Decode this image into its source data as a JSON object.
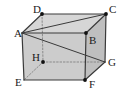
{
  "figure": {
    "kind": "geometry-diagram",
    "shape_name": "rectangular-cuboid",
    "stroke_color": "#3a3a3a",
    "dashed_color": "#8a8a8a",
    "face_fill_top": "#d6d6d6",
    "face_fill_front": "#cccccc",
    "face_fill_right": "#bfbfbf",
    "background_color": "#ffffff",
    "vertex_dot_color": "#111111",
    "vertices": [
      {
        "id": "A",
        "label": "A",
        "x": 22,
        "y": 33,
        "label_x": 14,
        "label_y": 37,
        "dot": false
      },
      {
        "id": "B",
        "label": "B",
        "x": 86,
        "y": 33,
        "label_x": 89,
        "label_y": 44,
        "dot": true
      },
      {
        "id": "C",
        "label": "C",
        "x": 106,
        "y": 14,
        "label_x": 109,
        "label_y": 13,
        "dot": true
      },
      {
        "id": "D",
        "label": "D",
        "x": 42,
        "y": 14,
        "label_x": 33,
        "label_y": 13,
        "dot": true
      },
      {
        "id": "E",
        "label": "E",
        "x": 24,
        "y": 80,
        "label_x": 15,
        "label_y": 86,
        "dot": false
      },
      {
        "id": "F",
        "label": "F",
        "x": 85,
        "y": 80,
        "label_x": 89,
        "label_y": 88,
        "dot": true
      },
      {
        "id": "G",
        "label": "G",
        "x": 105,
        "y": 62,
        "label_x": 108,
        "label_y": 66,
        "dot": false
      },
      {
        "id": "H",
        "label": "H",
        "x": 43,
        "y": 62,
        "label_x": 32,
        "label_y": 61,
        "dot": true
      }
    ],
    "solid_edges": [
      {
        "from": "D",
        "to": "C",
        "name": "edge-DC"
      },
      {
        "from": "D",
        "to": "A",
        "name": "edge-DA"
      },
      {
        "from": "A",
        "to": "B",
        "name": "edge-AB"
      },
      {
        "from": "B",
        "to": "C",
        "name": "edge-BC"
      },
      {
        "from": "A",
        "to": "E",
        "name": "edge-AE"
      },
      {
        "from": "B",
        "to": "F",
        "name": "edge-BF"
      },
      {
        "from": "C",
        "to": "G",
        "name": "edge-CG"
      },
      {
        "from": "E",
        "to": "F",
        "name": "edge-EF"
      },
      {
        "from": "F",
        "to": "G",
        "name": "edge-FG"
      }
    ],
    "dashed_edges": [
      {
        "from": "D",
        "to": "H",
        "name": "edge-DH-hidden"
      },
      {
        "from": "H",
        "to": "G",
        "name": "edge-HG-hidden"
      },
      {
        "from": "H",
        "to": "E",
        "name": "edge-HE-hidden"
      }
    ],
    "diagonals": [
      {
        "from": "A",
        "to": "C",
        "name": "diagonal-AC"
      },
      {
        "from": "A",
        "to": "G",
        "name": "diagonal-AG"
      }
    ]
  }
}
